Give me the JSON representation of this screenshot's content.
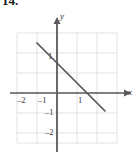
{
  "problem": {
    "number": "14."
  },
  "colors": {
    "grid": "#d9d9de",
    "axis": "#58585c",
    "line": "#55555a",
    "text": "#2a2a2a",
    "background": "#ffffff"
  },
  "chart_data": {
    "type": "line",
    "title": "",
    "xlabel": "x",
    "ylabel": "y",
    "xlim": [
      -2.3,
      2.7
    ],
    "ylim": [
      -2.6,
      3.2
    ],
    "grid": true,
    "grid_spacing": 1,
    "legend": null,
    "x_tick_labels": [
      "–2",
      "–1",
      "1"
    ],
    "x_ticks": [
      -2,
      -1,
      1
    ],
    "y_tick_labels": [
      "1",
      "–1",
      "–2"
    ],
    "y_ticks": [
      1,
      -1,
      -2
    ],
    "axes_arrows": [
      "x-positive",
      "y-positive"
    ],
    "series": [
      {
        "name": "line",
        "type": "line",
        "slope": -1,
        "y_intercept": 1.5,
        "x_intercept": 1.5,
        "points": [
          [
            -1.0,
            2.5
          ],
          [
            0.0,
            1.5
          ],
          [
            1.5,
            0.0
          ],
          [
            2.4,
            -0.9
          ]
        ]
      }
    ]
  },
  "labels": {
    "x_axis": "x",
    "y_axis": "y",
    "x_neg2": "–2",
    "x_neg1": "–1",
    "x_pos1": "1",
    "y_pos1": "1",
    "y_neg1": "–1",
    "y_neg2": "–2"
  }
}
